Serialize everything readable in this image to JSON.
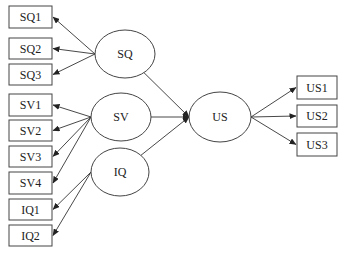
{
  "diagram": {
    "type": "structural-equation-model",
    "latent_variables": [
      {
        "id": "SQ",
        "label": "SQ",
        "cx": 125,
        "cy": 54,
        "rx": 30,
        "ry": 24
      },
      {
        "id": "SV",
        "label": "SV",
        "cx": 121,
        "cy": 117,
        "rx": 30,
        "ry": 24
      },
      {
        "id": "IQ",
        "label": "IQ",
        "cx": 120,
        "cy": 172,
        "rx": 29,
        "ry": 24
      },
      {
        "id": "US",
        "label": "US",
        "cx": 220,
        "cy": 117,
        "rx": 31,
        "ry": 25
      }
    ],
    "indicators": [
      {
        "id": "SQ1",
        "label": "SQ1",
        "x": 9,
        "y": 6,
        "w": 43,
        "h": 22,
        "factor": "SQ"
      },
      {
        "id": "SQ2",
        "label": "SQ2",
        "x": 9,
        "y": 38,
        "w": 43,
        "h": 21,
        "factor": "SQ"
      },
      {
        "id": "SQ3",
        "label": "SQ3",
        "x": 9,
        "y": 64,
        "w": 43,
        "h": 21,
        "factor": "SQ"
      },
      {
        "id": "SV1",
        "label": "SV1",
        "x": 9,
        "y": 94,
        "w": 43,
        "h": 22,
        "factor": "SV"
      },
      {
        "id": "SV2",
        "label": "SV2",
        "x": 9,
        "y": 120,
        "w": 43,
        "h": 21,
        "factor": "SV"
      },
      {
        "id": "SV3",
        "label": "SV3",
        "x": 9,
        "y": 146,
        "w": 43,
        "h": 21,
        "factor": "SV"
      },
      {
        "id": "SV4",
        "label": "SV4",
        "x": 9,
        "y": 172,
        "w": 43,
        "h": 22,
        "factor": "SV"
      },
      {
        "id": "IQ1",
        "label": "IQ1",
        "x": 9,
        "y": 199,
        "w": 43,
        "h": 21,
        "factor": "IQ"
      },
      {
        "id": "IQ2",
        "label": "IQ2",
        "x": 9,
        "y": 225,
        "w": 43,
        "h": 21,
        "factor": "IQ"
      },
      {
        "id": "US1",
        "label": "US1",
        "x": 297,
        "y": 76,
        "w": 40,
        "h": 23,
        "factor": "US"
      },
      {
        "id": "US2",
        "label": "US2",
        "x": 297,
        "y": 105,
        "w": 40,
        "h": 22,
        "factor": "US"
      },
      {
        "id": "US3",
        "label": "US3",
        "x": 297,
        "y": 133,
        "w": 40,
        "h": 23,
        "factor": "US"
      }
    ],
    "paths": [
      {
        "from": "SQ",
        "to": "US"
      },
      {
        "from": "SV",
        "to": "US"
      },
      {
        "from": "IQ",
        "to": "US"
      }
    ],
    "caption": {
      "visible": true,
      "cut_off": true,
      "text": ""
    }
  }
}
